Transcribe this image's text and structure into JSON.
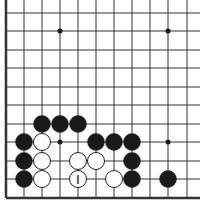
{
  "board": {
    "description": "Go problem diagram, lower-left corner view",
    "columns_x": [
      6,
      24,
      42,
      60,
      78,
      96,
      114,
      132,
      150,
      168,
      187
    ],
    "rows_y": [
      13,
      31,
      50,
      68,
      87,
      105,
      124,
      142,
      161,
      179,
      198
    ],
    "left_edge_x": 6,
    "bottom_edge_y": 198,
    "star_points": [
      [
        60,
        31
      ],
      [
        168,
        31
      ],
      [
        60,
        142
      ],
      [
        168,
        142
      ]
    ],
    "stone_radius": 8.5,
    "colors": {
      "line": "#333333",
      "black": "#1a1a1a",
      "white": "#ffffff",
      "edge": "#222222"
    },
    "stones": [
      {
        "color": "black",
        "x": 42,
        "y": 124
      },
      {
        "color": "black",
        "x": 60,
        "y": 124
      },
      {
        "color": "black",
        "x": 78,
        "y": 124
      },
      {
        "color": "black",
        "x": 24,
        "y": 142
      },
      {
        "color": "white",
        "x": 42,
        "y": 142
      },
      {
        "color": "black",
        "x": 96,
        "y": 142
      },
      {
        "color": "black",
        "x": 114,
        "y": 142
      },
      {
        "color": "black",
        "x": 132,
        "y": 142
      },
      {
        "color": "black",
        "x": 24,
        "y": 161
      },
      {
        "color": "white",
        "x": 42,
        "y": 161
      },
      {
        "color": "white",
        "x": 78,
        "y": 161
      },
      {
        "color": "white",
        "x": 96,
        "y": 161
      },
      {
        "color": "black",
        "x": 132,
        "y": 161
      },
      {
        "color": "black",
        "x": 24,
        "y": 179
      },
      {
        "color": "white",
        "x": 42,
        "y": 179
      },
      {
        "color": "white",
        "x": 78,
        "y": 179,
        "label": "I"
      },
      {
        "color": "white",
        "x": 114,
        "y": 179
      },
      {
        "color": "black",
        "x": 132,
        "y": 179
      },
      {
        "color": "black",
        "x": 168,
        "y": 179
      }
    ]
  }
}
